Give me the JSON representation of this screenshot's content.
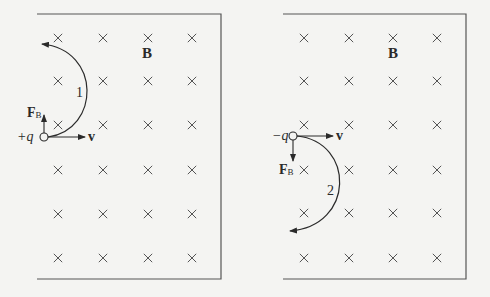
{
  "diagram": {
    "type": "charged particles in uniform magnetic field (into page)",
    "colors": {
      "background": "#f4f4f2",
      "frame": "#555555",
      "cross": "#555555",
      "ink": "#2a2a2a"
    },
    "panels": [
      {
        "id": "left",
        "field_label": "B",
        "charge_label": "+q",
        "velocity_label": "v",
        "force_label_main": "F",
        "force_label_sub": "B",
        "force_direction": "up",
        "path_label": "1",
        "path_direction": "counterclockwise (curves up, right side bulge)",
        "frame": {
          "x1": 37,
          "y1": 14,
          "x2": 221,
          "y2": 279,
          "open_side": "left"
        },
        "cross_columns": [
          58,
          103,
          148,
          192
        ],
        "cross_rows": [
          38,
          81,
          125,
          170,
          214,
          258
        ]
      },
      {
        "id": "right",
        "field_label": "B",
        "charge_label": "−q",
        "velocity_label": "v",
        "force_label_main": "F",
        "force_label_sub": "B",
        "force_direction": "down",
        "path_label": "2",
        "path_direction": "clockwise (curves down, right side bulge)",
        "frame": {
          "x1": 283,
          "y1": 14,
          "x2": 466,
          "y2": 279,
          "open_side": "left"
        },
        "cross_columns": [
          304,
          349,
          393,
          437
        ],
        "cross_rows": [
          38,
          81,
          125,
          170,
          213,
          258
        ]
      }
    ],
    "cross_symbol": "×"
  }
}
